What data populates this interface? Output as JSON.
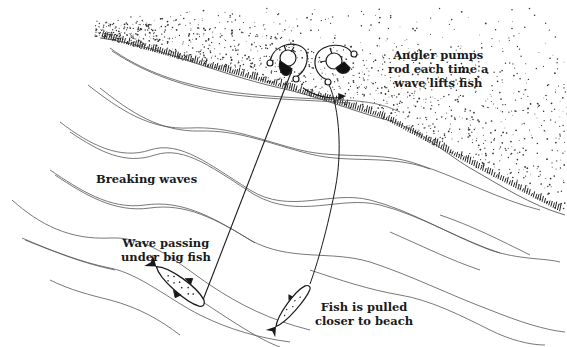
{
  "figure": {
    "colors": {
      "ink": "#1a1a1a",
      "wave": "#555555",
      "background": "#ffffff",
      "sand_dots": "#333333"
    }
  },
  "labels": {
    "angler_line1": "Angler pumps",
    "angler_line2": "rod each time a",
    "angler_line3": "wave lifts fish",
    "breaking_waves": "Breaking waves",
    "wave_passing_line1": "Wave passing",
    "wave_passing_line2": "under big fish",
    "fish_pulled_line1": "Fish is pulled",
    "fish_pulled_line2": "closer to beach"
  },
  "elements": {
    "anglers": [
      "angler-before",
      "angler-after"
    ],
    "fish": [
      "big-fish-far",
      "fish-closer"
    ],
    "arrow": "rotation-arrow",
    "shore": "beach-sand"
  }
}
